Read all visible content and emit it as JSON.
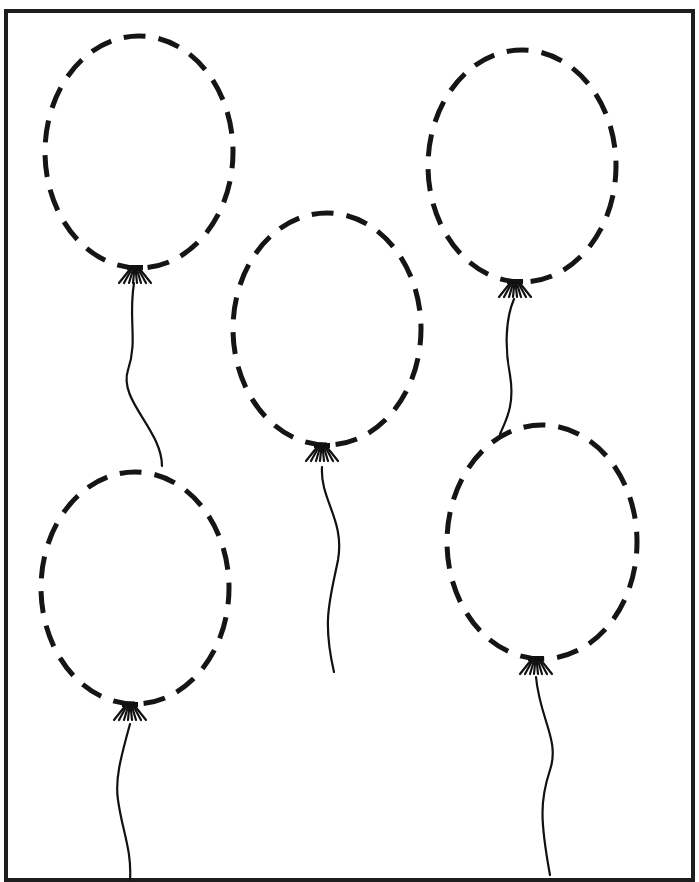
{
  "worksheet": {
    "type": "tracing-worksheet",
    "subject": "balloons",
    "frame": {
      "x": 6,
      "y": 11,
      "width": 687,
      "height": 869,
      "color": "#1e1e1e"
    },
    "line_color": "#151515",
    "balloons": [
      {
        "id": "top-left",
        "cx": 139,
        "cy": 152,
        "rx": 94,
        "ry": 116,
        "knot": [
          135,
          271
        ],
        "string": "M134,283 C128,320 138,340 128,370 C118,400 162,430 162,466"
      },
      {
        "id": "center",
        "cx": 327,
        "cy": 329,
        "rx": 94,
        "ry": 116,
        "knot": [
          322,
          449
        ],
        "string": "M322,467 C320,500 345,520 338,560 C330,600 322,620 334,672"
      },
      {
        "id": "top-right",
        "cx": 522,
        "cy": 166,
        "rx": 94,
        "ry": 116,
        "knot": [
          515,
          285
        ],
        "string": "M514,299 C505,320 505,350 510,375 C515,405 506,420 500,434"
      },
      {
        "id": "bottom-left",
        "cx": 135,
        "cy": 588,
        "rx": 94,
        "ry": 116,
        "knot": [
          130,
          708
        ],
        "string": "M130,724 C120,760 115,780 118,800 C122,830 132,850 130,880"
      },
      {
        "id": "bottom-right",
        "cx": 542,
        "cy": 542,
        "rx": 95,
        "ry": 117,
        "knot": [
          536,
          662
        ],
        "string": "M536,677 C540,720 560,740 550,770 C540,800 540,820 550,875"
      }
    ]
  }
}
